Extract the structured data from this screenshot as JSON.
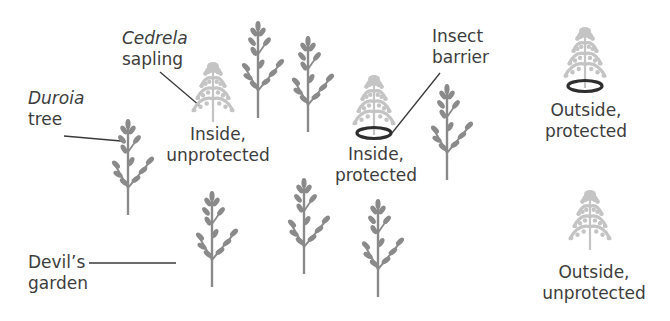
{
  "figure": {
    "type": "illustration"
  },
  "labels": {
    "cedrela": {
      "italic": "Cedrela",
      "line2": "sapling"
    },
    "duroia": {
      "italic": "Duroia",
      "line2": "tree"
    },
    "insect_barrier": {
      "line1": "Insect",
      "line2": "barrier"
    },
    "devils_garden": {
      "line1": "Devil’s",
      "line2": "garden"
    },
    "inside_unprotected": {
      "line1": "Inside,",
      "line2": "unprotected"
    },
    "inside_protected": {
      "line1": "Inside,",
      "line2": "protected"
    },
    "outside_protected": {
      "line1": "Outside,",
      "line2": "protected"
    },
    "outside_unprotected": {
      "line1": "Outside,",
      "line2": "unprotected"
    }
  },
  "colors": {
    "duroia_tree": "#8a8a8a",
    "cedrela_sapling": "#c4c4c4",
    "barrier_ring": "#2e2e2e",
    "leader_line": "#3a3a3a",
    "text": "#3d3d3d"
  },
  "plants": {
    "duroia_trees": [
      {
        "x": 128,
        "top": 118,
        "base": 215
      },
      {
        "x": 258,
        "top": 20,
        "base": 118
      },
      {
        "x": 308,
        "top": 35,
        "base": 132
      },
      {
        "x": 447,
        "top": 83,
        "base": 180
      },
      {
        "x": 212,
        "top": 190,
        "base": 287
      },
      {
        "x": 304,
        "top": 177,
        "base": 274
      },
      {
        "x": 378,
        "top": 198,
        "base": 297
      }
    ],
    "cedrela_saplings": [
      {
        "name": "inside-unprotected",
        "x": 213,
        "top": 62,
        "base": 122,
        "barrier": false
      },
      {
        "name": "inside-protected",
        "x": 374,
        "top": 75,
        "base": 135,
        "barrier": true
      },
      {
        "name": "outside-protected",
        "x": 585,
        "top": 27,
        "base": 88,
        "barrier": true
      },
      {
        "name": "outside-unprotected",
        "x": 590,
        "top": 190,
        "base": 250,
        "barrier": false
      }
    ]
  }
}
